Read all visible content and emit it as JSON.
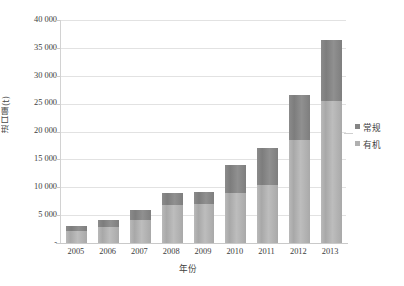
{
  "chart_data": {
    "type": "bar",
    "subtype": "stacked-vertical",
    "title": "",
    "xlabel": "年份",
    "ylabel": "进口量(t)",
    "ylim": [
      0,
      40000
    ],
    "ytick_step": 5000,
    "ytick_labels": [
      "40 000",
      "35 000",
      "30 000",
      "25 000",
      "20 000",
      "15 000",
      "10 000",
      "5 000",
      "-"
    ],
    "ytick_values": [
      40000,
      35000,
      30000,
      25000,
      20000,
      15000,
      10000,
      5000,
      0
    ],
    "categories": [
      "2005",
      "2006",
      "2007",
      "2008",
      "2009",
      "2010",
      "2011",
      "2012",
      "2013"
    ],
    "grid": true,
    "grid_axis": "y",
    "legend_position": "right",
    "series": [
      {
        "name": "有机",
        "stack_order": "bottom",
        "color": "#b0b0b0",
        "values": [
          2100,
          2800,
          4200,
          6800,
          7000,
          9000,
          10400,
          18500,
          25500
        ]
      },
      {
        "name": "常规",
        "stack_order": "top",
        "color": "#858585",
        "values": [
          900,
          1400,
          1800,
          2200,
          2200,
          5000,
          6600,
          8000,
          11000
        ]
      }
    ],
    "totals": [
      3000,
      4200,
      6000,
      9000,
      9200,
      14000,
      17000,
      26500,
      36500
    ]
  },
  "legend": {
    "items": [
      {
        "label": "常规",
        "color": "#858585"
      },
      {
        "label": "有机",
        "color": "#b0b0b0"
      }
    ]
  }
}
